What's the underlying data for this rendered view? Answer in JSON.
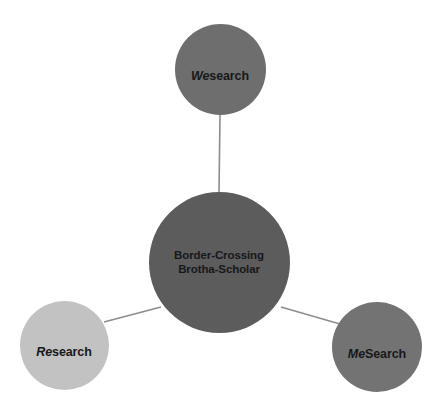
{
  "diagram": {
    "type": "radial-concept-map",
    "background_color": "#ffffff",
    "edge_color": "#8c8c8c",
    "label_color": "#17181a",
    "hub": {
      "id": "hub",
      "label": "Border-Crossing\nBrotha-Scholar",
      "label_line_1": "Border-Crossing",
      "label_line_2": "Brotha-Scholar",
      "color": "#5c5c5c",
      "center_x": 219,
      "center_y": 262,
      "diameter": 141
    },
    "nodes": [
      {
        "id": "wesearch",
        "label": "Wesearch",
        "italic_prefix": "We",
        "roman_suffix": "search",
        "color": "#6e6e6e",
        "center_x": 220,
        "center_y": 69,
        "diameter": 91,
        "position": "top"
      },
      {
        "id": "research",
        "label": "Research",
        "italic_prefix": "Re",
        "roman_suffix": "search",
        "color": "#c2c2c2",
        "center_x": 64,
        "center_y": 345,
        "diameter": 89,
        "position": "bottom-left"
      },
      {
        "id": "mesearch",
        "label": "MeSearch",
        "italic_prefix": "Me",
        "roman_suffix": "Search",
        "color": "#737373",
        "center_x": 377,
        "center_y": 347,
        "diameter": 90,
        "position": "bottom-right"
      }
    ],
    "edges": [
      {
        "id": "edge-hub-wesearch",
        "from": "hub",
        "to": "wesearch",
        "x1": 219,
        "y1": 192,
        "x2": 220,
        "y2": 115
      },
      {
        "id": "edge-hub-research",
        "from": "hub",
        "to": "research",
        "x1": 161,
        "y1": 307,
        "x2": 104,
        "y2": 322
      },
      {
        "id": "edge-hub-mesearch",
        "from": "hub",
        "to": "mesearch",
        "x1": 281,
        "y1": 307,
        "x2": 340,
        "y2": 324
      }
    ]
  }
}
